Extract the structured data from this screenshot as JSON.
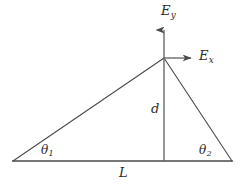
{
  "figure": {
    "type": "geometry-diagram",
    "stroke_color": "#4a4a4a",
    "text_color": "#2b2b2b",
    "background_color": "#ffffff",
    "width": 245,
    "height": 185
  },
  "geometry": {
    "apex": {
      "x": 164,
      "y": 58
    },
    "left_vertex": {
      "x": 13,
      "y": 161
    },
    "right_vertex": {
      "x": 232,
      "y": 161
    },
    "baseline_y": 161,
    "vertical_drop_x": 164,
    "arrow_y_tip": {
      "x": 164,
      "y": 26
    },
    "arrow_x_tip": {
      "x": 196,
      "y": 58
    }
  },
  "labels": {
    "e_y": {
      "base": "E",
      "sub": "y",
      "full": "Ey"
    },
    "e_x": {
      "base": "E",
      "sub": "x",
      "full": "Ex"
    },
    "d": {
      "base": "d",
      "sub": "",
      "full": "d"
    },
    "l": {
      "base": "L",
      "sub": "",
      "full": "L"
    },
    "theta_1": {
      "base": "θ",
      "sub": "1",
      "full": "θ1"
    },
    "theta_2": {
      "base": "θ",
      "sub": "2",
      "full": "θ2"
    }
  }
}
